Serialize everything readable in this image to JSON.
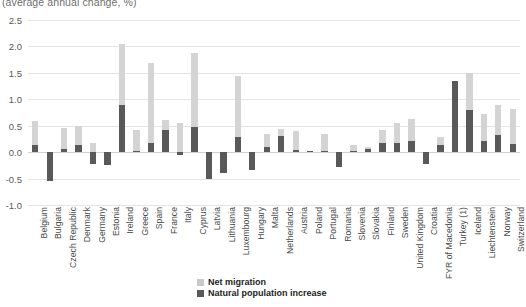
{
  "subtitle": "(average annual change, %)",
  "colors": {
    "net_migration": "#d4d4d4",
    "natural_increase": "#595959",
    "gridline": "#e4e4e4",
    "text": "#4a4a4a"
  },
  "legend": {
    "position": "bottom-center",
    "items": [
      {
        "label": "Net migration",
        "color": "#d4d4d4",
        "key": "net_migration"
      },
      {
        "label": "Natural population increase",
        "color": "#595959",
        "key": "natural_increase"
      }
    ]
  },
  "yaxis": {
    "ticks": [
      "2.5",
      "2.0",
      "1.5",
      "1.0",
      "0.5",
      "0.0",
      "-0.5",
      "-1.0"
    ],
    "min": -1.0,
    "max": 2.5
  },
  "chart_data": {
    "type": "bar",
    "subtype": "stacked-bar-with-negatives",
    "title": "",
    "subtitle": "(average annual change, %)",
    "xlabel": "",
    "ylabel": "",
    "ylim": [
      -1.0,
      2.5
    ],
    "ytick_step": 0.5,
    "grid": true,
    "legend": [
      "Net migration",
      "Natural population increase"
    ],
    "categories": [
      "Belgium",
      "Bulgaria",
      "Czech Republic",
      "Denmark",
      "Germany",
      "Estonia",
      "Ireland",
      "Greece",
      "Spain",
      "France",
      "Italy",
      "Cyprus",
      "Latvia",
      "Lithuania",
      "Luxembourg",
      "Hungary",
      "Malta",
      "Netherlands",
      "Austria",
      "Poland",
      "Portugal",
      "Romania",
      "Slovenia",
      "Slovakia",
      "Finland",
      "Sweden",
      "United Kingdom",
      "Croatia",
      "FYR of Macedonia",
      "Turkey (1)",
      "Iceland",
      "Liechtenstein",
      "Norway",
      "Switzerland"
    ],
    "series": [
      {
        "name": "Net migration",
        "color": "#d4d4d4",
        "values": [
          0.46,
          0.0,
          0.4,
          0.37,
          0.18,
          0.0,
          1.15,
          0.39,
          1.51,
          0.18,
          0.55,
          1.4,
          0.0,
          0.0,
          1.17,
          0.0,
          0.25,
          0.13,
          0.36,
          0.0,
          0.33,
          0.0,
          0.12,
          0.03,
          0.25,
          0.38,
          0.41,
          0.0,
          0.15,
          0.0,
          0.7,
          0.5,
          0.56,
          0.67
        ]
      },
      {
        "name": "Natural population increase",
        "color": "#595959",
        "values": [
          0.13,
          -0.55,
          0.06,
          0.13,
          -0.22,
          -0.25,
          0.9,
          0.02,
          0.17,
          0.42,
          -0.06,
          0.48,
          -0.5,
          -0.4,
          0.28,
          -0.34,
          0.09,
          0.3,
          0.04,
          0.03,
          0.02,
          -0.28,
          0.02,
          0.06,
          0.17,
          0.18,
          0.21,
          -0.23,
          0.13,
          1.35,
          0.8,
          0.22,
          0.33,
          0.15
        ]
      }
    ]
  }
}
